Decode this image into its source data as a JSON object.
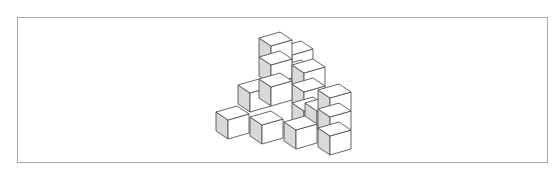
{
  "figure": {
    "label": ")",
    "colors": {
      "frame": "#a8a8a8",
      "edge": "#555555",
      "left_face": "#d9d9d9",
      "face": "#ffffff"
    },
    "cube_vectors": {
      "right": [
        21,
        -6
      ],
      "front": [
        12,
        8
      ],
      "height": 19
    },
    "cubes": [
      [
        280,
        47
      ],
      [
        280,
        66
      ],
      [
        259,
        38
      ],
      [
        259,
        57
      ],
      [
        292,
        65
      ],
      [
        292,
        84
      ],
      [
        238,
        85
      ],
      [
        259,
        79
      ],
      [
        292,
        103
      ],
      [
        305,
        103
      ],
      [
        318,
        90
      ],
      [
        318,
        109
      ],
      [
        318,
        128
      ],
      [
        216,
        112
      ],
      [
        250,
        117
      ],
      [
        284,
        122
      ]
    ]
  }
}
